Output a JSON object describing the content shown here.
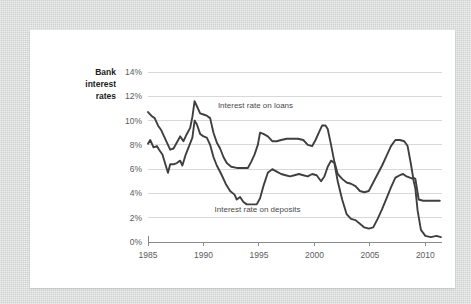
{
  "chart_data": {
    "type": "line",
    "title_lines": [
      "Bank",
      "interest",
      "rates"
    ],
    "xlabel": "",
    "ylabel": "Bank interest rates",
    "grid": true,
    "legend_position": "inline-annotation",
    "xlim": [
      1985,
      2011.5
    ],
    "ylim": [
      0,
      14
    ],
    "x_ticks": [
      1985,
      1990,
      1995,
      2000,
      2005,
      2010
    ],
    "x_tick_labels": [
      "1985",
      "1990",
      "1995",
      "2000",
      "2005",
      "2010"
    ],
    "y_ticks": [
      0,
      2,
      4,
      6,
      8,
      10,
      12,
      14
    ],
    "y_tick_labels": [
      "0%",
      "2%",
      "4%",
      "6%",
      "8%",
      "10%",
      "12%",
      "14%"
    ],
    "annotations": [
      {
        "text": "Interest rate on loans",
        "x": 1991.3,
        "y": 11.0
      },
      {
        "text": "Interest rate on deposits",
        "x": 1991.0,
        "y": 2.45
      }
    ],
    "series": [
      {
        "name": "Interest rate on loans",
        "label": "Interest rate on loans",
        "color": "#3f3f3f",
        "x": [
          1985.0,
          1985.3,
          1985.6,
          1985.9,
          1986.2,
          1986.5,
          1986.8,
          1987.0,
          1987.3,
          1987.6,
          1987.9,
          1988.2,
          1988.5,
          1988.8,
          1989.0,
          1989.2,
          1989.4,
          1989.7,
          1990.0,
          1990.3,
          1990.6,
          1990.9,
          1991.2,
          1991.5,
          1991.8,
          1992.1,
          1992.5,
          1993.0,
          1993.5,
          1994.0,
          1994.3,
          1994.6,
          1994.9,
          1995.1,
          1995.4,
          1995.8,
          1996.2,
          1996.6,
          1997.0,
          1997.5,
          1998.0,
          1998.5,
          1999.0,
          1999.4,
          1999.8,
          2000.1,
          2000.4,
          2000.7,
          2001.0,
          2001.2,
          2001.5,
          2001.8,
          2002.1,
          2002.5,
          2002.9,
          2003.3,
          2003.7,
          2004.1,
          2004.5,
          2004.9,
          2005.3,
          2005.7,
          2006.1,
          2006.5,
          2006.9,
          2007.3,
          2007.7,
          2008.1,
          2008.4,
          2008.7,
          2008.9,
          2009.1,
          2009.4,
          2009.8,
          2010.3,
          2010.8,
          2011.3
        ],
        "y": [
          10.7,
          10.4,
          10.2,
          9.6,
          9.2,
          8.6,
          8.0,
          7.6,
          7.7,
          8.2,
          8.7,
          8.3,
          8.9,
          9.4,
          10.3,
          11.6,
          11.2,
          10.6,
          10.5,
          10.4,
          10.2,
          9.0,
          8.2,
          7.7,
          7.0,
          6.5,
          6.2,
          6.1,
          6.1,
          6.1,
          6.6,
          7.2,
          8.0,
          9.0,
          8.9,
          8.7,
          8.3,
          8.3,
          8.4,
          8.5,
          8.5,
          8.5,
          8.4,
          8.0,
          7.9,
          8.4,
          9.0,
          9.6,
          9.6,
          9.3,
          8.0,
          6.6,
          5.6,
          5.2,
          4.9,
          4.8,
          4.6,
          4.2,
          4.1,
          4.2,
          4.9,
          5.6,
          6.3,
          7.1,
          7.9,
          8.4,
          8.4,
          8.3,
          7.9,
          6.4,
          5.3,
          5.2,
          3.5,
          3.4,
          3.4,
          3.4,
          3.4
        ]
      },
      {
        "name": "Interest rate on deposits",
        "label": "Interest rate on deposits",
        "color": "#3f3f3f",
        "x": [
          1985.0,
          1985.2,
          1985.5,
          1985.8,
          1986.0,
          1986.3,
          1986.6,
          1986.8,
          1987.0,
          1987.3,
          1987.6,
          1987.9,
          1988.1,
          1988.4,
          1988.7,
          1989.0,
          1989.2,
          1989.4,
          1989.7,
          1990.0,
          1990.3,
          1990.6,
          1990.9,
          1991.2,
          1991.6,
          1992.0,
          1992.4,
          1992.8,
          1993.0,
          1993.3,
          1993.6,
          1993.9,
          1994.2,
          1994.5,
          1994.8,
          1995.1,
          1995.4,
          1995.8,
          1996.2,
          1996.6,
          1997.0,
          1997.4,
          1997.8,
          1998.2,
          1998.6,
          1999.0,
          1999.4,
          1999.8,
          2000.2,
          2000.6,
          2000.9,
          2001.2,
          2001.5,
          2001.8,
          2002.1,
          2002.5,
          2002.9,
          2003.3,
          2003.7,
          2004.1,
          2004.5,
          2004.9,
          2005.3,
          2005.7,
          2006.1,
          2006.5,
          2006.9,
          2007.3,
          2007.7,
          2008.0,
          2008.3,
          2008.6,
          2008.9,
          2009.1,
          2009.3,
          2009.6,
          2010.0,
          2010.5,
          2011.0,
          2011.4
        ],
        "y": [
          8.1,
          8.4,
          7.8,
          7.9,
          7.6,
          7.2,
          6.3,
          5.7,
          6.4,
          6.4,
          6.5,
          6.7,
          6.3,
          7.2,
          7.9,
          8.6,
          10.0,
          9.7,
          8.9,
          8.7,
          8.6,
          8.0,
          7.0,
          6.3,
          5.6,
          4.8,
          4.2,
          3.9,
          3.5,
          3.7,
          3.3,
          3.1,
          3.1,
          3.1,
          3.1,
          3.6,
          4.6,
          5.7,
          6.0,
          5.8,
          5.6,
          5.5,
          5.4,
          5.5,
          5.6,
          5.5,
          5.4,
          5.6,
          5.5,
          5.0,
          5.4,
          6.2,
          6.7,
          6.5,
          5.0,
          3.5,
          2.3,
          1.9,
          1.8,
          1.5,
          1.2,
          1.1,
          1.2,
          1.9,
          2.7,
          3.6,
          4.5,
          5.3,
          5.5,
          5.6,
          5.4,
          5.3,
          5.2,
          4.4,
          2.6,
          1.0,
          0.5,
          0.4,
          0.5,
          0.4
        ]
      }
    ]
  }
}
